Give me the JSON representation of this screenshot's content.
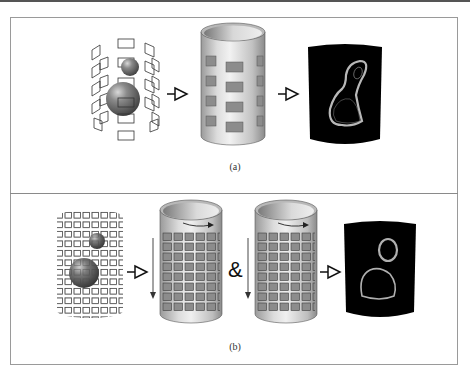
{
  "figure": {
    "panels": [
      {
        "id": "a",
        "caption": "(a)",
        "steps": [
          "coil-array-with-spheres",
          "cylinder-with-coil-array",
          "reconstructed-image"
        ],
        "coil_grid": {
          "rows": 4,
          "columns_visible": 3
        },
        "operators": [
          "arrow",
          "arrow"
        ]
      },
      {
        "id": "b",
        "caption": "(b)",
        "steps": [
          "dense-coil-array-with-spheres",
          "cylinder-dense-array-scan-1",
          "cylinder-dense-array-scan-2",
          "reconstructed-image"
        ],
        "coil_grid": {
          "rows": 8,
          "columns_visible": 6
        },
        "operators": [
          "arrow",
          "ampersand",
          "arrow"
        ],
        "ampersand": "&"
      }
    ],
    "colors": {
      "frame": "#9a9a9a",
      "cylinder_light": "#e6e6e6",
      "cylinder_dark": "#9a9a9a",
      "coil_fill": "#8c8c8c",
      "image_bg": "#000000",
      "image_contour": "#b8b8b8",
      "sphere": "#7a7a7a"
    }
  }
}
